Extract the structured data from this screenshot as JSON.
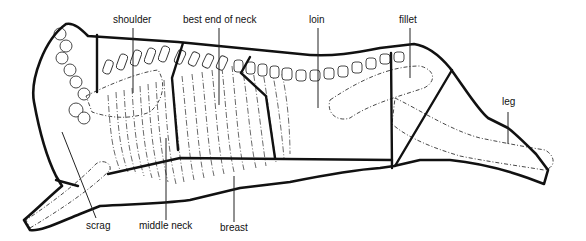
{
  "diagram": {
    "line_color": "#111111",
    "background": "#ffffff",
    "labels": {
      "shoulder": "shoulder",
      "best_end_of_neck": "best end of neck",
      "loin": "loin",
      "fillet": "fillet",
      "leg": "leg",
      "scrag": "scrag",
      "middle_neck": "middle neck",
      "breast": "breast"
    }
  }
}
